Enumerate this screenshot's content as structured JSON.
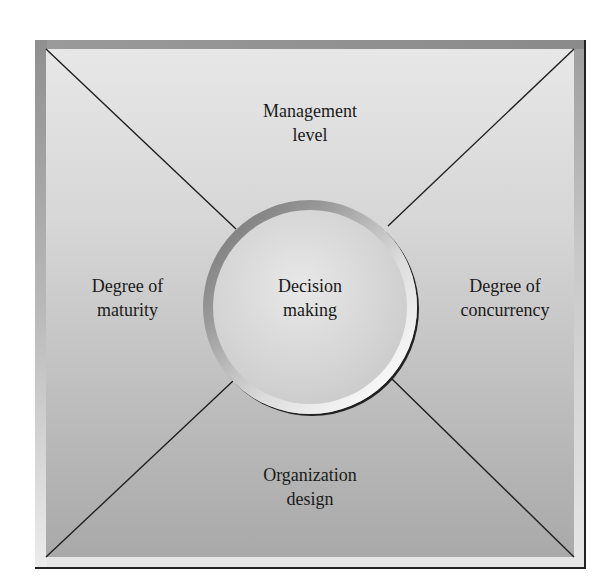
{
  "diagram": {
    "center": {
      "lines": [
        "Decision",
        "making"
      ]
    },
    "top": {
      "lines": [
        "Management",
        "level"
      ]
    },
    "left": {
      "lines": [
        "Degree of",
        "maturity"
      ]
    },
    "right": {
      "lines": [
        "Degree of",
        "concurrency"
      ]
    },
    "bottom": {
      "lines": [
        "Organization",
        "design"
      ]
    }
  }
}
